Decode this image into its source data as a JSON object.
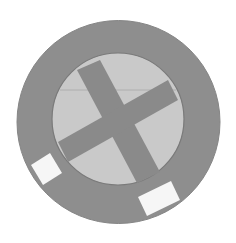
{
  "graphic": {
    "description": "Grey disc with light inner circle containing a dark X and two white squares on the outer ring",
    "colors": {
      "background": "#ffffff",
      "outer_ring": "#8e8e8e",
      "inner_disc": "#c9c9c9",
      "cross": "#8a8a8a",
      "square": "#f6f6f6",
      "line": "#a8a8a8"
    }
  }
}
